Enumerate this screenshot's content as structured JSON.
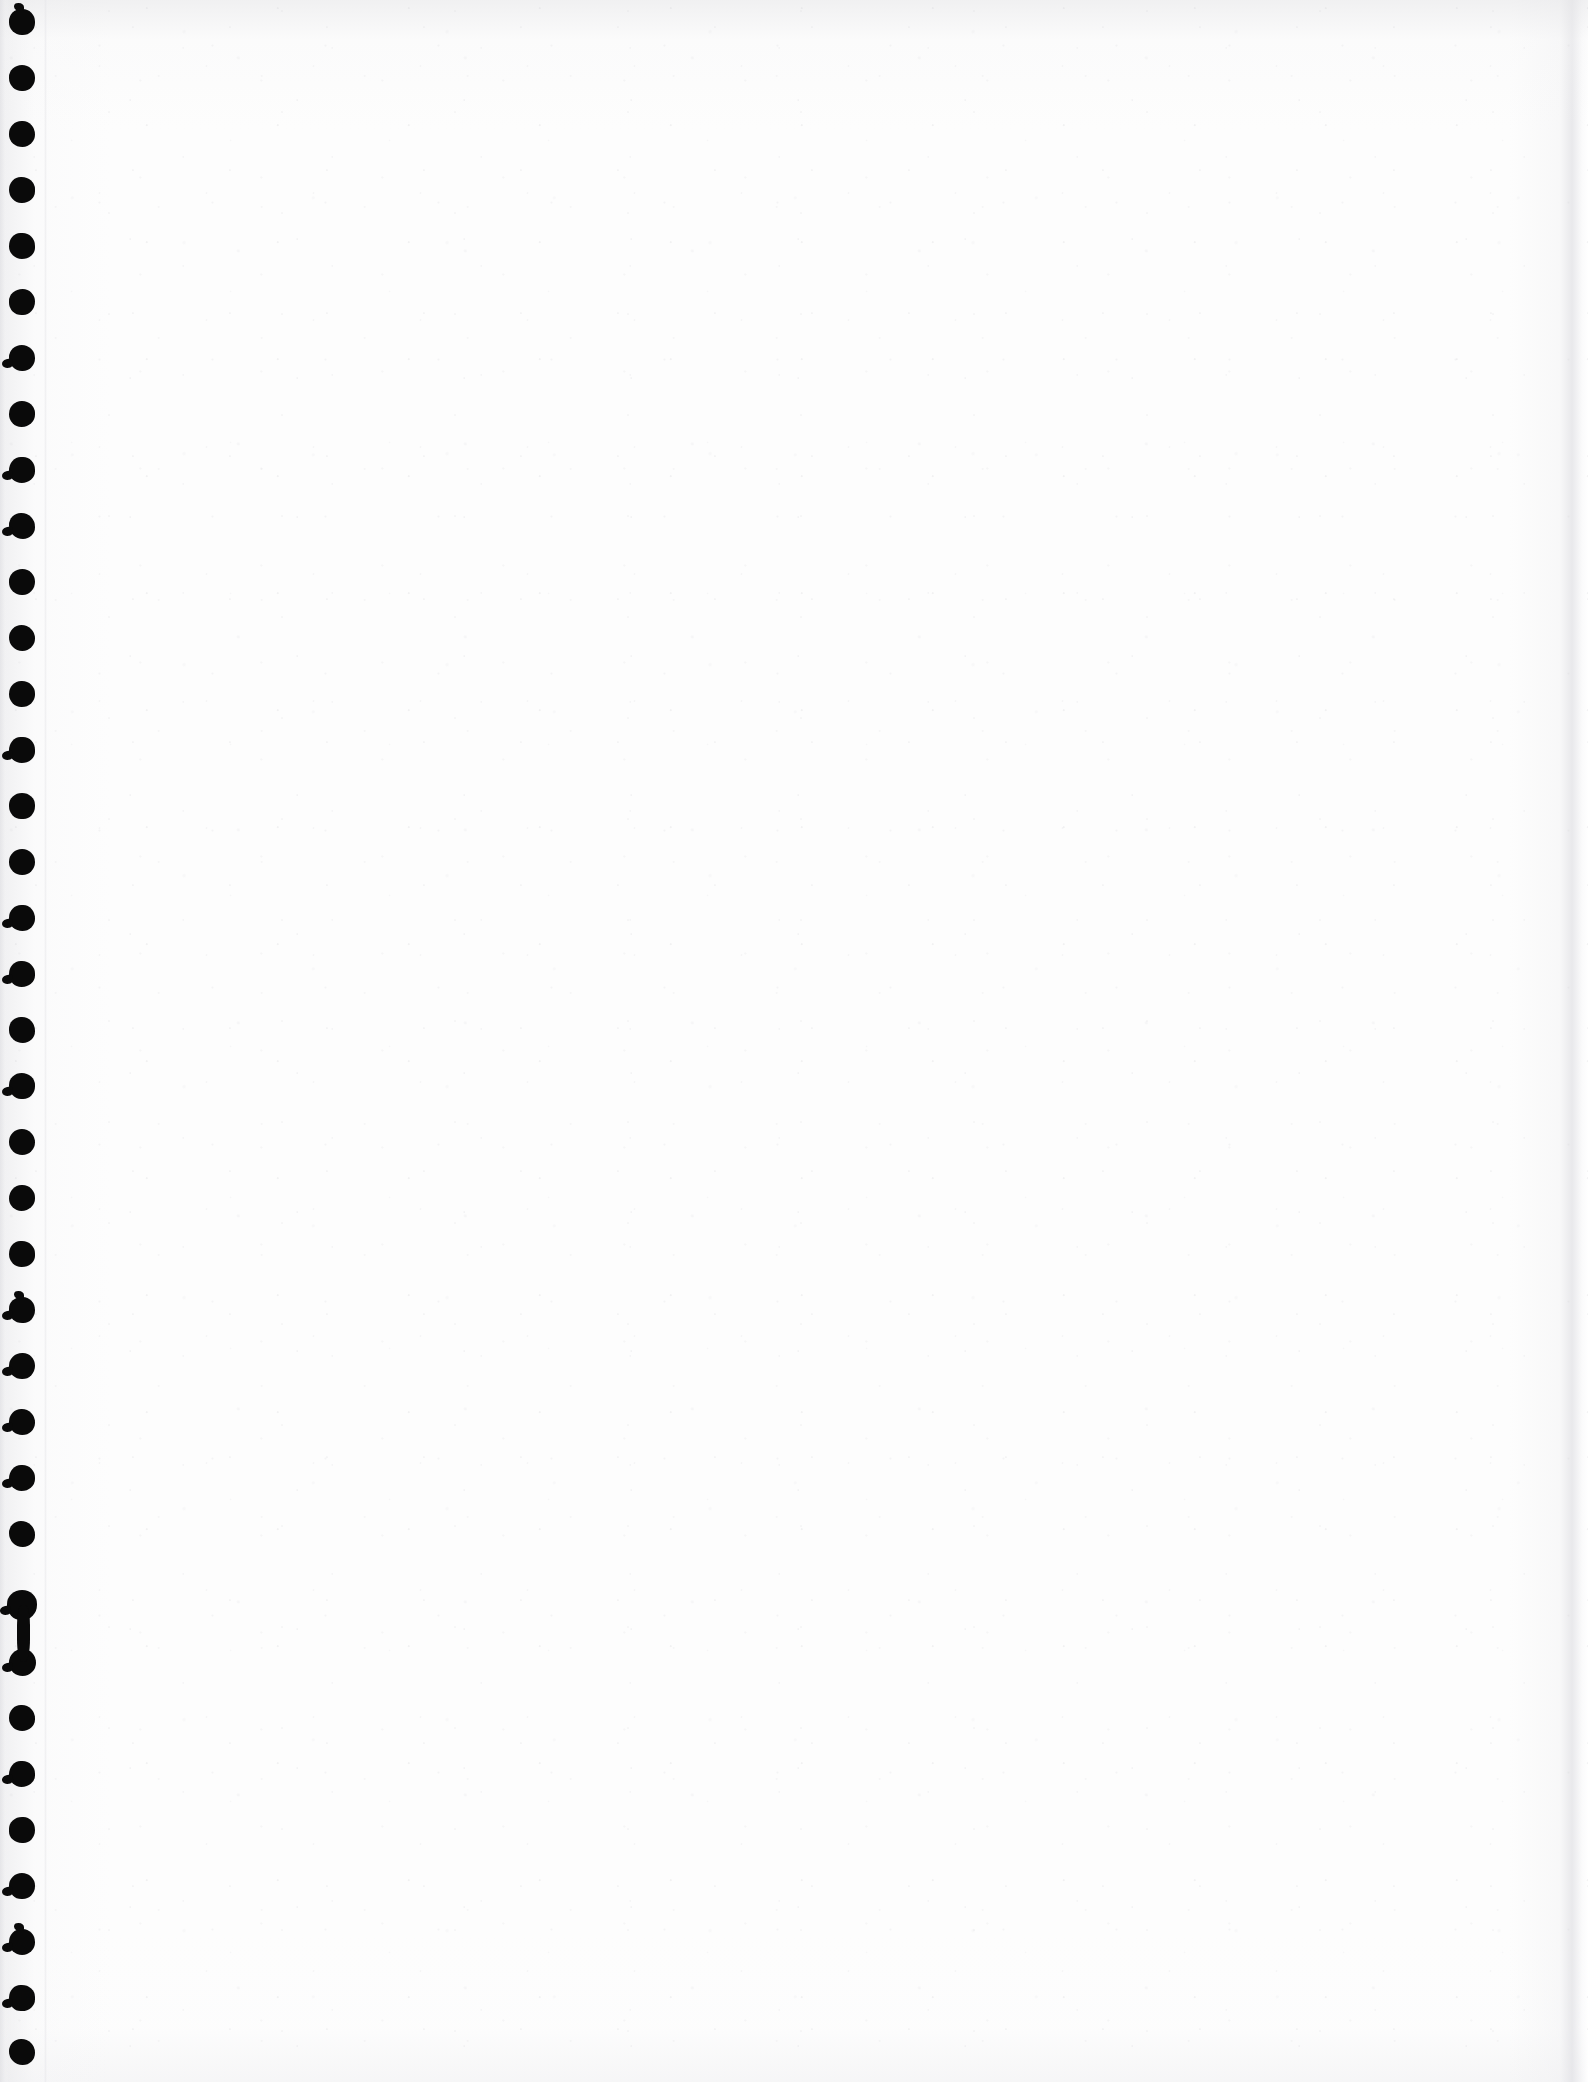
{
  "document": {
    "kind": "scanned-page",
    "title": "Scanned blank notebook page",
    "page_width": 1588,
    "page_height": 2082,
    "visible_text": "",
    "text_blocks": [],
    "paper_color": "#fdfdfd",
    "ink_color": "#0a0a0a",
    "shadow_color": "#e0e0e4",
    "orientation": "portrait",
    "content_note": ""
  },
  "binding": {
    "type": "spiral-punched-holes",
    "edge": "left",
    "hole_color": "#0a0a0a",
    "hole_count": 37,
    "hole_diameter": 26,
    "hole_spacing": 56,
    "first_hole_center_y": 22,
    "column_center_x": 22,
    "holes": [
      {
        "cy": 22,
        "d": 26,
        "torn": false,
        "torn_up": true
      },
      {
        "cy": 78,
        "d": 26,
        "torn": false,
        "torn_up": false
      },
      {
        "cy": 134,
        "d": 26,
        "torn": false,
        "torn_up": false
      },
      {
        "cy": 190,
        "d": 26,
        "torn": false,
        "torn_up": false
      },
      {
        "cy": 246,
        "d": 26,
        "torn": false,
        "torn_up": false
      },
      {
        "cy": 302,
        "d": 26,
        "torn": false,
        "torn_up": false
      },
      {
        "cy": 358,
        "d": 26,
        "torn": true,
        "torn_up": false
      },
      {
        "cy": 414,
        "d": 26,
        "torn": false,
        "torn_up": false
      },
      {
        "cy": 470,
        "d": 26,
        "torn": true,
        "torn_up": false
      },
      {
        "cy": 526,
        "d": 26,
        "torn": true,
        "torn_up": false
      },
      {
        "cy": 582,
        "d": 26,
        "torn": false,
        "torn_up": false
      },
      {
        "cy": 638,
        "d": 26,
        "torn": false,
        "torn_up": false
      },
      {
        "cy": 694,
        "d": 26,
        "torn": false,
        "torn_up": false
      },
      {
        "cy": 750,
        "d": 26,
        "torn": true,
        "torn_up": false
      },
      {
        "cy": 806,
        "d": 26,
        "torn": false,
        "torn_up": false
      },
      {
        "cy": 862,
        "d": 26,
        "torn": false,
        "torn_up": false
      },
      {
        "cy": 918,
        "d": 26,
        "torn": true,
        "torn_up": false
      },
      {
        "cy": 974,
        "d": 26,
        "torn": true,
        "torn_up": false
      },
      {
        "cy": 1030,
        "d": 26,
        "torn": false,
        "torn_up": false
      },
      {
        "cy": 1086,
        "d": 26,
        "torn": true,
        "torn_up": false
      },
      {
        "cy": 1142,
        "d": 26,
        "torn": false,
        "torn_up": false
      },
      {
        "cy": 1198,
        "d": 26,
        "torn": false,
        "torn_up": false
      },
      {
        "cy": 1254,
        "d": 26,
        "torn": false,
        "torn_up": false
      },
      {
        "cy": 1310,
        "d": 26,
        "torn": true,
        "torn_up": true
      },
      {
        "cy": 1366,
        "d": 26,
        "torn": true,
        "torn_up": false
      },
      {
        "cy": 1422,
        "d": 26,
        "torn": true,
        "torn_up": false
      },
      {
        "cy": 1478,
        "d": 26,
        "torn": true,
        "torn_up": false
      },
      {
        "cy": 1534,
        "d": 26,
        "torn": false,
        "torn_up": false
      },
      {
        "cy": 1605,
        "d": 30,
        "torn": true,
        "torn_up": false
      },
      {
        "cy": 1662,
        "d": 27,
        "torn": true,
        "torn_up": false
      },
      {
        "cy": 1718,
        "d": 26,
        "torn": false,
        "torn_up": false
      },
      {
        "cy": 1774,
        "d": 26,
        "torn": true,
        "torn_up": false
      },
      {
        "cy": 1830,
        "d": 26,
        "torn": false,
        "torn_up": false
      },
      {
        "cy": 1886,
        "d": 26,
        "torn": true,
        "torn_up": false
      },
      {
        "cy": 1942,
        "d": 26,
        "torn": true,
        "torn_up": true
      },
      {
        "cy": 1998,
        "d": 26,
        "torn": true,
        "torn_up": false
      },
      {
        "cy": 2052,
        "d": 26,
        "torn": false,
        "torn_up": false
      }
    ],
    "merged_bridge": {
      "from_cy": 1605,
      "to_cy": 1662,
      "width": 13
    }
  }
}
